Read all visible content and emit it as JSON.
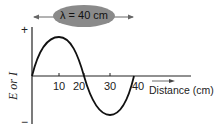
{
  "diagram": {
    "wavelength_label": "λ = 40 cm",
    "y_axis_label": "E or I",
    "y_plus": "+",
    "y_minus": "−",
    "x_axis_label": "Distance (cm)",
    "x_ticks": [
      "10",
      "20",
      "30",
      "40"
    ],
    "colors": {
      "ellipse": "#8a8a8a",
      "curve": "#111111",
      "axis": "#222222"
    }
  }
}
